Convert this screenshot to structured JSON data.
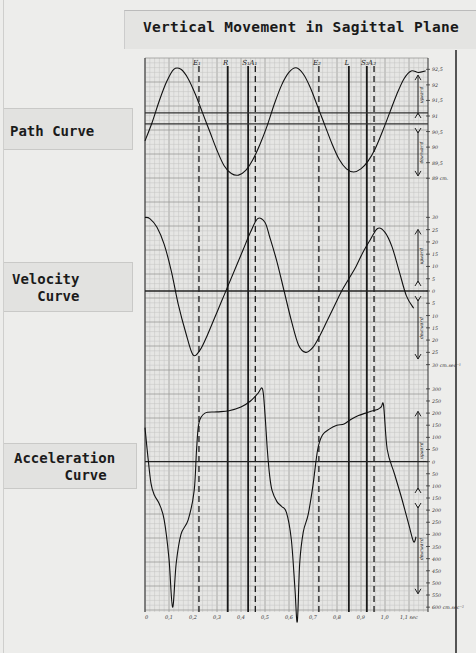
{
  "title": "Vertical Movement in Sagittal Plane",
  "labels": {
    "path": "Path Curve",
    "velocity": "Velocity\n   Curve",
    "acceleration": "Acceleration\n      Curve"
  },
  "chart_data": [
    {
      "type": "line",
      "name": "path",
      "title": "Path Curve",
      "ylabel": "cm",
      "xlabel": "sec",
      "xlim": [
        0,
        1.18
      ],
      "ylim": [
        88.75,
        92.8
      ],
      "yticks": [
        92.5,
        92,
        91.5,
        91,
        90.5,
        90,
        89.5,
        89
      ],
      "ytick_labels": [
        "92,5",
        "92",
        "91,5",
        "91",
        "90,5",
        "90",
        "89,5",
        "89 cm."
      ],
      "reference_lines": [
        90.75,
        91.1
      ],
      "annotations": [
        "upward",
        "downward"
      ],
      "x": [
        0,
        0.03,
        0.06,
        0.09,
        0.12,
        0.15,
        0.18,
        0.21,
        0.24,
        0.27,
        0.3,
        0.33,
        0.36,
        0.39,
        0.42,
        0.45,
        0.48,
        0.51,
        0.54,
        0.57,
        0.6,
        0.63,
        0.66,
        0.69,
        0.72,
        0.75,
        0.78,
        0.81,
        0.84,
        0.87,
        0.9,
        0.93,
        0.96,
        0.99,
        1.02,
        1.05,
        1.08,
        1.11,
        1.14,
        1.17
      ],
      "y": [
        90.2,
        90.8,
        91.5,
        92.1,
        92.5,
        92.5,
        92.2,
        91.7,
        91.1,
        90.5,
        89.9,
        89.4,
        89.15,
        89.1,
        89.25,
        89.6,
        90.1,
        90.7,
        91.4,
        92.0,
        92.4,
        92.55,
        92.35,
        91.9,
        91.3,
        90.7,
        90.1,
        89.6,
        89.3,
        89.2,
        89.3,
        89.55,
        89.95,
        90.5,
        91.1,
        91.7,
        92.2,
        92.45,
        92.4,
        92.45
      ]
    },
    {
      "type": "line",
      "name": "velocity",
      "title": "Velocity Curve",
      "ylabel": "cm.sec⁻¹",
      "xlabel": "sec",
      "xlim": [
        0,
        1.18
      ],
      "ylim": [
        -33,
        33
      ],
      "yticks": [
        30,
        25,
        20,
        15,
        10,
        5,
        0,
        -5,
        -10,
        -15,
        -20,
        -25,
        -30
      ],
      "ytick_labels": [
        "30",
        "25",
        "20",
        "15",
        "10",
        "5",
        "0",
        "5",
        "10",
        "15",
        "20",
        "25",
        "30 cm.sec⁻¹"
      ],
      "annotations": [
        "upward",
        "downward"
      ],
      "x": [
        0,
        0.02,
        0.05,
        0.08,
        0.11,
        0.14,
        0.17,
        0.2,
        0.23,
        0.26,
        0.29,
        0.32,
        0.35,
        0.38,
        0.41,
        0.44,
        0.47,
        0.5,
        0.52,
        0.55,
        0.58,
        0.61,
        0.64,
        0.67,
        0.7,
        0.73,
        0.76,
        0.79,
        0.82,
        0.85,
        0.88,
        0.91,
        0.94,
        0.97,
        1.0,
        1.03,
        1.06,
        1.09,
        1.12
      ],
      "y": [
        30,
        29.5,
        26,
        19,
        8,
        -6,
        -17,
        -26,
        -24,
        -18,
        -11,
        -4,
        3,
        10,
        17,
        24,
        29.5,
        28,
        22,
        12,
        0,
        -12,
        -22,
        -25,
        -23,
        -18,
        -12,
        -6,
        0,
        5,
        10,
        16,
        21,
        25.5,
        24,
        18,
        8,
        -2,
        -7
      ]
    },
    {
      "type": "line",
      "name": "acceleration",
      "title": "Acceleration Curve",
      "ylabel": "cm.sec⁻²",
      "xlabel": "sec",
      "xlim": [
        0,
        1.18
      ],
      "ylim": [
        -620,
        320
      ],
      "yticks": [
        300,
        250,
        200,
        150,
        100,
        50,
        0,
        -50,
        -100,
        -150,
        -200,
        -250,
        -300,
        -350,
        -400,
        -450,
        -500,
        -550,
        -600
      ],
      "ytick_labels": [
        "300",
        "250",
        "200",
        "150",
        "100",
        "50",
        "0",
        "50",
        "100",
        "150",
        "200",
        "250",
        "300",
        "350",
        "400",
        "450",
        "500",
        "550",
        "600 cm.sec⁻²"
      ],
      "xticks": [
        0,
        0.1,
        0.2,
        0.3,
        0.4,
        0.5,
        0.6,
        0.7,
        0.8,
        0.9,
        1.0,
        1.1
      ],
      "xtick_labels": [
        "0",
        "0,1",
        "0,2",
        "0,3",
        "0,4",
        "0,5",
        "0,6",
        "0,7",
        "0,8",
        "0,9",
        "1,0",
        "1,1 sec"
      ],
      "annotations": [
        "upward",
        "downward"
      ],
      "x": [
        0,
        0.01,
        0.025,
        0.04,
        0.06,
        0.08,
        0.1,
        0.115,
        0.13,
        0.15,
        0.18,
        0.205,
        0.215,
        0.225,
        0.25,
        0.3,
        0.35,
        0.4,
        0.44,
        0.47,
        0.49,
        0.5,
        0.51,
        0.52,
        0.53,
        0.55,
        0.57,
        0.59,
        0.61,
        0.625,
        0.635,
        0.645,
        0.66,
        0.68,
        0.7,
        0.72,
        0.74,
        0.77,
        0.8,
        0.83,
        0.86,
        0.89,
        0.92,
        0.95,
        0.97,
        0.985,
        0.995,
        1.01,
        1.04,
        1.07,
        1.1,
        1.12,
        1.13
      ],
      "y": [
        140,
        40,
        -90,
        -140,
        -175,
        -240,
        -400,
        -600,
        -420,
        -300,
        -240,
        -120,
        50,
        160,
        200,
        205,
        210,
        225,
        250,
        280,
        300,
        200,
        50,
        -60,
        -120,
        -165,
        -185,
        -210,
        -320,
        -520,
        -660,
        -420,
        -290,
        -220,
        -100,
        50,
        110,
        135,
        150,
        155,
        175,
        190,
        200,
        210,
        215,
        225,
        230,
        50,
        -50,
        -150,
        -260,
        -330,
        -310
      ]
    }
  ],
  "markers": [
    {
      "label": "E₁",
      "x": 0.225,
      "style": "dashed"
    },
    {
      "label": "R",
      "x": 0.345,
      "style": "solid"
    },
    {
      "label": "S₁",
      "x": 0.43,
      "style": "solid"
    },
    {
      "label": "A₁",
      "x": 0.46,
      "style": "dashed"
    },
    {
      "label": "E₂",
      "x": 0.725,
      "style": "dashed"
    },
    {
      "label": "L",
      "x": 0.85,
      "style": "solid"
    },
    {
      "label": "S₂",
      "x": 0.925,
      "style": "solid"
    },
    {
      "label": "A₂",
      "x": 0.955,
      "style": "dashed"
    }
  ]
}
